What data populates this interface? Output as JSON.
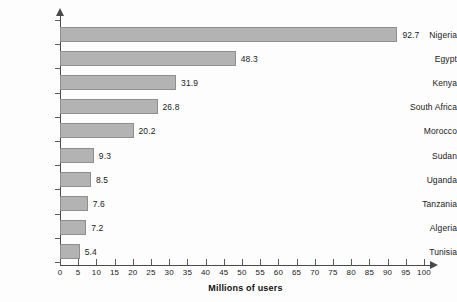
{
  "chart_data": {
    "type": "bar",
    "orientation": "horizontal",
    "title": "",
    "xlabel": "Millions of users",
    "ylabel": "",
    "xlim": [
      0,
      100
    ],
    "xticks": [
      0,
      5,
      10,
      15,
      20,
      25,
      30,
      35,
      40,
      45,
      50,
      55,
      60,
      65,
      70,
      75,
      80,
      85,
      90,
      95,
      100
    ],
    "grid": false,
    "legend": null,
    "categories": [
      "Nigeria",
      "Egypt",
      "Kenya",
      "South Africa",
      "Morocco",
      "Sudan",
      "Uganda",
      "Tanzania",
      "Algeria",
      "Tunisia"
    ],
    "values": [
      92.7,
      48.3,
      31.9,
      26.8,
      20.2,
      9.3,
      8.5,
      7.6,
      7.2,
      5.4
    ],
    "value_labels": [
      "92.7",
      "48.3",
      "31.9",
      "26.8",
      "20.2",
      "9.3",
      "8.5",
      "7.6",
      "7.2",
      "5.4"
    ],
    "bar_color": "#b3b3b3",
    "bar_border_color": "#8f8f8f",
    "axis_color": "#4a4a4a",
    "background": "#fdfdfd"
  }
}
